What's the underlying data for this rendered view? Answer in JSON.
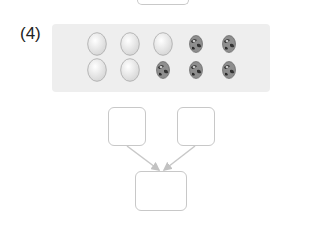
{
  "problem": {
    "number_label": "(4)",
    "eggs": {
      "rows": [
        [
          "plain",
          "plain",
          "plain",
          "spotted",
          "spotted"
        ],
        [
          "plain",
          "plain",
          "spotted",
          "spotted",
          "spotted"
        ]
      ],
      "plain_count": 5,
      "spotted_count": 5,
      "total": 10
    },
    "boxes": {
      "top_left": "",
      "top_right": "",
      "bottom": ""
    }
  }
}
